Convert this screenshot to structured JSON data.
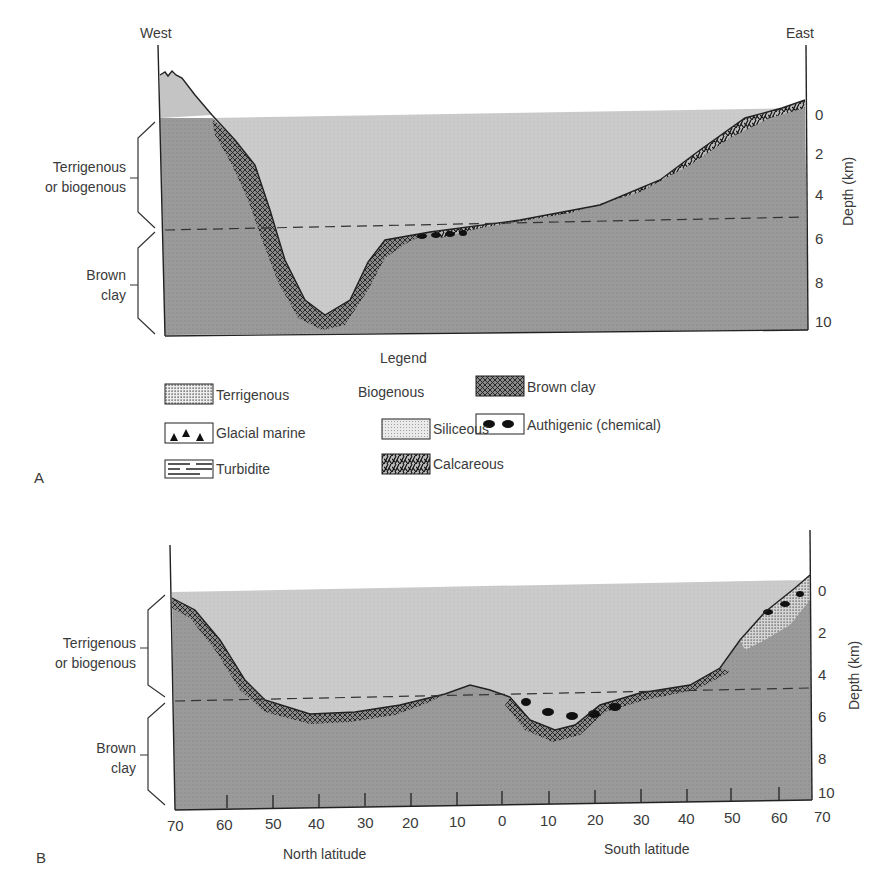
{
  "panel_a": {
    "label": "A",
    "west_label": "West",
    "east_label": "East",
    "left_bracket_top": [
      "Terrigenous",
      "or biogenous"
    ],
    "left_bracket_bottom": [
      "Brown",
      "clay"
    ],
    "depth_axis_title": "Depth (km)",
    "depth_ticks": [
      "0",
      "2",
      "4",
      "6",
      "8",
      "10"
    ]
  },
  "legend": {
    "title": "Legend",
    "biogenous_heading": "Biogenous",
    "items": {
      "terrigenous": "Terrigenous",
      "glacial_marine": "Glacial marine",
      "turbidite": "Turbidite",
      "siliceous": "Siliceous",
      "calcareous": "Calcareous",
      "brown_clay": "Brown clay",
      "authigenic": "Authigenic (chemical)"
    }
  },
  "panel_b": {
    "label": "B",
    "left_bracket_top": [
      "Terrigenous",
      "or biogenous"
    ],
    "left_bracket_bottom": [
      "Brown",
      "clay"
    ],
    "depth_axis_title": "Depth (km)",
    "depth_ticks": [
      "0",
      "2",
      "4",
      "6",
      "8",
      "10"
    ],
    "north_ticks": [
      "70",
      "60",
      "50",
      "40",
      "30",
      "20",
      "10"
    ],
    "center_tick": "0",
    "south_ticks": [
      "10",
      "20",
      "30",
      "40",
      "50",
      "60",
      "70"
    ],
    "north_label": "North latitude",
    "south_label": "South latitude"
  },
  "colors": {
    "water": "#c9c9c9",
    "seafloor": "#9a9a9a",
    "line": "#222222"
  }
}
